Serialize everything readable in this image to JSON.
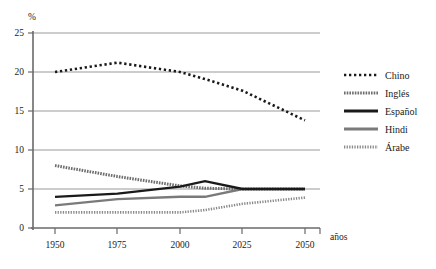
{
  "chart_data": {
    "type": "line",
    "title": "",
    "xlabel": "años",
    "ylabel": "%",
    "xlim": [
      1950,
      2050
    ],
    "ylim": [
      0,
      25
    ],
    "xticks": [
      "1950",
      "1975",
      "2000",
      "2025",
      "2050"
    ],
    "yticks": [
      "0",
      "5",
      "10",
      "15",
      "20",
      "25"
    ],
    "grid": "horizontal",
    "legend_position": "right",
    "x": [
      1950,
      1975,
      2000,
      2010,
      2025,
      2050
    ],
    "series": [
      {
        "name": "Chino",
        "style": "dotted",
        "color": "#1a1a1a",
        "values": [
          20.0,
          21.2,
          20.0,
          19.1,
          17.6,
          13.8
        ]
      },
      {
        "name": "Inglés",
        "style": "dashed",
        "color": "#6e6e6e",
        "values": [
          8.0,
          6.6,
          5.4,
          5.1,
          5.0,
          5.0
        ]
      },
      {
        "name": "Español",
        "style": "solid-thick",
        "color": "#1a1a1a",
        "values": [
          4.0,
          4.4,
          5.3,
          6.0,
          5.0,
          5.0
        ]
      },
      {
        "name": "Hindi",
        "style": "solid-medium",
        "color": "#7a7a7a",
        "values": [
          2.9,
          3.7,
          4.0,
          4.0,
          5.0,
          5.0
        ]
      },
      {
        "name": "Árabe",
        "style": "dotted-open",
        "color": "#8a8a8a",
        "values": [
          2.0,
          2.0,
          2.0,
          2.3,
          3.1,
          3.9
        ]
      }
    ]
  },
  "axis": {
    "y_unit": "%",
    "x_unit": "años",
    "y_labels": [
      "25",
      "20",
      "15",
      "10",
      "5",
      "0"
    ],
    "x_labels": [
      "1950",
      "1975",
      "2000",
      "2025",
      "2050"
    ]
  },
  "legend": {
    "items": [
      {
        "label": "Chino"
      },
      {
        "label": "Inglés"
      },
      {
        "label": "Español"
      },
      {
        "label": "Hindi"
      },
      {
        "label": "Árabe"
      }
    ]
  }
}
